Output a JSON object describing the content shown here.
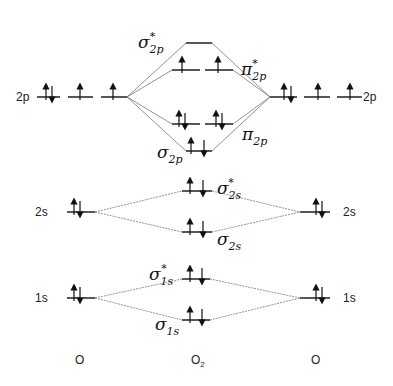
{
  "diagram": {
    "type": "molecular-orbital-diagram",
    "molecule": "O2",
    "columns": {
      "left_atom": "O",
      "center_molecule": "O",
      "center_subscript": "2",
      "right_atom": "O"
    },
    "atomic_orbitals": {
      "2p": {
        "label": "2p",
        "electrons_per_orbital": [
          "up-down",
          "up",
          "up"
        ]
      },
      "2s": {
        "label": "2s",
        "electrons": "up-down"
      },
      "1s": {
        "label": "1s",
        "electrons": "up-down"
      }
    },
    "molecular_orbitals": [
      {
        "id": "sigma_2p_star",
        "symbol": "σ",
        "sub": "2p",
        "star": "*",
        "electrons": []
      },
      {
        "id": "pi_2p_star",
        "symbol": "π",
        "sub": "2p",
        "star": "*",
        "electrons": [
          "up",
          "up"
        ]
      },
      {
        "id": "pi_2p",
        "symbol": "π",
        "sub": "2p",
        "star": "",
        "electrons": [
          "up-down",
          "up-down"
        ]
      },
      {
        "id": "sigma_2p",
        "symbol": "σ",
        "sub": "2p",
        "star": "",
        "electrons": [
          "up-down"
        ]
      },
      {
        "id": "sigma_2s_star",
        "symbol": "σ",
        "sub": "2s",
        "star": "*",
        "electrons": [
          "up-down"
        ]
      },
      {
        "id": "sigma_2s",
        "symbol": "σ",
        "sub": "2s",
        "star": "",
        "electrons": [
          "up-down"
        ]
      },
      {
        "id": "sigma_1s_star",
        "symbol": "σ",
        "sub": "1s",
        "star": "*",
        "electrons": [
          "up-down"
        ]
      },
      {
        "id": "sigma_1s",
        "symbol": "σ",
        "sub": "1s",
        "star": "",
        "electrons": [
          "up-down"
        ]
      }
    ],
    "labels": {
      "sigma": "σ",
      "pi": "π",
      "star": "*",
      "sub_2p": "2p",
      "sub_2s": "2s",
      "sub_1s": "1s",
      "ao_2p": "2p",
      "ao_2s": "2s",
      "ao_1s": "1s"
    }
  }
}
